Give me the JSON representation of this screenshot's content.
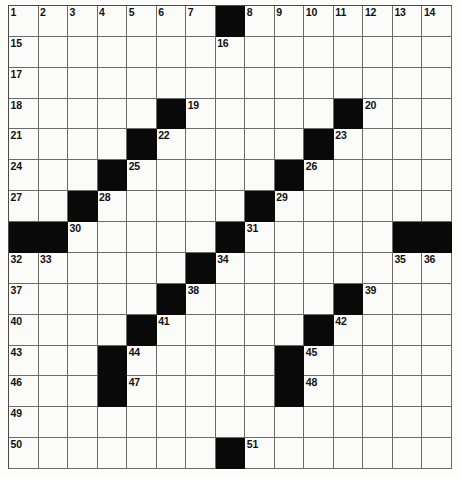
{
  "puzzle": {
    "kind": "crossword-grid",
    "rows": 15,
    "columns": 15,
    "colors": {
      "block": "#090909",
      "cell": "#fbfbfa",
      "grid_line": "#6b6b6b",
      "outer_border": "#4a4a4a",
      "number_text": "#111111",
      "page_background": "#fdfdfc"
    },
    "highest_number": 51,
    "block_count": 29,
    "blocks": [
      [
        0,
        7
      ],
      [
        3,
        5
      ],
      [
        3,
        11
      ],
      [
        4,
        4
      ],
      [
        4,
        10
      ],
      [
        5,
        3
      ],
      [
        5,
        9
      ],
      [
        6,
        2
      ],
      [
        6,
        8
      ],
      [
        7,
        1
      ],
      [
        7,
        7
      ],
      [
        7,
        13
      ],
      [
        8,
        0
      ],
      [
        8,
        1
      ],
      [
        8,
        7
      ],
      [
        8,
        13
      ],
      [
        8,
        14
      ],
      [
        9,
        6
      ],
      [
        10,
        5
      ],
      [
        10,
        11
      ],
      [
        11,
        4
      ],
      [
        11,
        10
      ],
      [
        12,
        3
      ],
      [
        12,
        9
      ],
      [
        13,
        3
      ],
      [
        13,
        9
      ],
      [
        14,
        7
      ]
    ],
    "numbers": [
      {
        "row": 0,
        "col": 0,
        "n": "1"
      },
      {
        "row": 0,
        "col": 1,
        "n": "2"
      },
      {
        "row": 0,
        "col": 2,
        "n": "3"
      },
      {
        "row": 0,
        "col": 3,
        "n": "4"
      },
      {
        "row": 0,
        "col": 4,
        "n": "5"
      },
      {
        "row": 0,
        "col": 5,
        "n": "6"
      },
      {
        "row": 0,
        "col": 6,
        "n": "7"
      },
      {
        "row": 0,
        "col": 8,
        "n": "8"
      },
      {
        "row": 0,
        "col": 9,
        "n": "9"
      },
      {
        "row": 0,
        "col": 10,
        "n": "10"
      },
      {
        "row": 0,
        "col": 11,
        "n": "11"
      },
      {
        "row": 0,
        "col": 12,
        "n": "12"
      },
      {
        "row": 0,
        "col": 13,
        "n": "13"
      },
      {
        "row": 0,
        "col": 14,
        "n": "14"
      },
      {
        "row": 1,
        "col": 0,
        "n": "15"
      },
      {
        "row": 1,
        "col": 7,
        "n": "16"
      },
      {
        "row": 2,
        "col": 0,
        "n": "17"
      },
      {
        "row": 3,
        "col": 0,
        "n": "18"
      },
      {
        "row": 3,
        "col": 6,
        "n": "19"
      },
      {
        "row": 3,
        "col": 12,
        "n": "20"
      },
      {
        "row": 4,
        "col": 0,
        "n": "21"
      },
      {
        "row": 4,
        "col": 5,
        "n": "22"
      },
      {
        "row": 4,
        "col": 11,
        "n": "23"
      },
      {
        "row": 5,
        "col": 0,
        "n": "24"
      },
      {
        "row": 5,
        "col": 4,
        "n": "25"
      },
      {
        "row": 5,
        "col": 10,
        "n": "26"
      },
      {
        "row": 6,
        "col": 0,
        "n": "27"
      },
      {
        "row": 6,
        "col": 3,
        "n": "28"
      },
      {
        "row": 6,
        "col": 9,
        "n": "29"
      },
      {
        "row": 7,
        "col": 2,
        "n": "30"
      },
      {
        "row": 7,
        "col": 8,
        "n": "31"
      },
      {
        "row": 8,
        "col": 2,
        "n": "30"
      },
      {
        "row": 8,
        "col": 8,
        "n": "31"
      },
      {
        "row": 9,
        "col": 0,
        "n": "32"
      },
      {
        "row": 9,
        "col": 1,
        "n": "33"
      },
      {
        "row": 9,
        "col": 7,
        "n": "34"
      },
      {
        "row": 9,
        "col": 13,
        "n": "35"
      },
      {
        "row": 9,
        "col": 14,
        "n": "36"
      },
      {
        "row": 10,
        "col": 0,
        "n": "37"
      },
      {
        "row": 10,
        "col": 6,
        "n": "38"
      },
      {
        "row": 10,
        "col": 12,
        "n": "39"
      },
      {
        "row": 11,
        "col": 0,
        "n": "40"
      },
      {
        "row": 11,
        "col": 5,
        "n": "41"
      },
      {
        "row": 11,
        "col": 11,
        "n": "42"
      },
      {
        "row": 12,
        "col": 0,
        "n": "43"
      },
      {
        "row": 12,
        "col": 4,
        "n": "44"
      },
      {
        "row": 12,
        "col": 10,
        "n": "45"
      },
      {
        "row": 13,
        "col": 0,
        "n": "46"
      },
      {
        "row": 13,
        "col": 4,
        "n": "47"
      },
      {
        "row": 13,
        "col": 10,
        "n": "48"
      },
      {
        "row": 14,
        "col": 0,
        "n": "50"
      },
      {
        "row": 14,
        "col": 8,
        "n": "51"
      }
    ],
    "row_overrides": {
      "note": "row 7 and row 8 of the rendered grid are distinct: row 7 shown as the 30/31 band, row 13 carries 46/47/48, row 14 carries 49 then 50/51 band"
    },
    "layout_rows": [
      {
        "index": 0,
        "blocks": [
          7
        ],
        "nums": {
          "0": "1",
          "1": "2",
          "2": "3",
          "3": "4",
          "4": "5",
          "5": "6",
          "6": "7",
          "8": "8",
          "9": "9",
          "10": "10",
          "11": "11",
          "12": "12",
          "13": "13",
          "14": "14"
        }
      },
      {
        "index": 1,
        "blocks": [],
        "nums": {
          "0": "15",
          "7": "16"
        }
      },
      {
        "index": 2,
        "blocks": [],
        "nums": {
          "0": "17"
        }
      },
      {
        "index": 3,
        "blocks": [
          5,
          11
        ],
        "nums": {
          "0": "18",
          "6": "19",
          "12": "20"
        }
      },
      {
        "index": 4,
        "blocks": [
          4,
          10
        ],
        "nums": {
          "0": "21",
          "5": "22",
          "11": "23"
        }
      },
      {
        "index": 5,
        "blocks": [
          3,
          9
        ],
        "nums": {
          "0": "24",
          "4": "25",
          "10": "26"
        }
      },
      {
        "index": 6,
        "blocks": [
          2,
          8
        ],
        "nums": {
          "0": "27",
          "3": "28",
          "9": "29"
        }
      },
      {
        "index": 7,
        "blocks": [
          0,
          1,
          7,
          13,
          14
        ],
        "nums": {
          "2": "30",
          "8": "31"
        }
      },
      {
        "index": 8,
        "blocks": [
          6
        ],
        "nums": {
          "0": "32",
          "1": "33",
          "7": "34",
          "13": "35",
          "14": "36"
        }
      },
      {
        "index": 9,
        "blocks": [
          5,
          11
        ],
        "nums": {
          "0": "37",
          "6": "38",
          "12": "39"
        }
      },
      {
        "index": 10,
        "blocks": [
          4,
          10
        ],
        "nums": {
          "0": "40",
          "5": "41",
          "11": "42"
        }
      },
      {
        "index": 11,
        "blocks": [
          3,
          9
        ],
        "nums": {
          "0": "43",
          "4": "44",
          "10": "45"
        }
      },
      {
        "index": 12,
        "blocks": [
          3,
          9
        ],
        "nums": {
          "0": "46",
          "4": "47",
          "10": "48"
        }
      },
      {
        "index": 13,
        "blocks": [],
        "nums": {
          "0": "49"
        }
      },
      {
        "index": 14,
        "blocks": [
          7
        ],
        "nums": {
          "0": "50",
          "8": "51"
        }
      }
    ]
  }
}
